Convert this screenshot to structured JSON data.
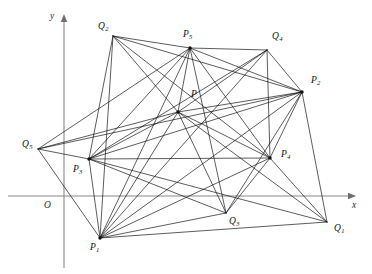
{
  "figure": {
    "width": 372,
    "height": 274,
    "background_color": "#ffffff",
    "line_color": "#101010",
    "axis_color": "#8a8a8a"
  },
  "axes": {
    "origin_label": "O",
    "origin_label_x": 44,
    "origin_label_y": 201,
    "x_axis_label": "x",
    "x_axis_label_x": 352,
    "x_axis_label_y": 201,
    "y_axis_label": "y",
    "y_axis_label_x": 50,
    "y_axis_label_y": 12,
    "origin_x": 64,
    "origin_y": 196,
    "x_axis_start_x": 8,
    "x_axis_end_x": 356,
    "y_axis_top_y": 14,
    "y_axis_bottom_y": 268
  },
  "points": [
    {
      "id": "P",
      "label": "P",
      "sub": "",
      "x": 178,
      "y": 112,
      "label_x": 191,
      "label_y": 90,
      "show_dot": true
    },
    {
      "id": "P1",
      "label": "P",
      "sub": "1",
      "x": 100,
      "y": 238,
      "label_x": 90,
      "label_y": 243,
      "show_dot": true
    },
    {
      "id": "P2",
      "label": "P",
      "sub": "2",
      "x": 302,
      "y": 92,
      "label_x": 311,
      "label_y": 76,
      "show_dot": true
    },
    {
      "id": "P3",
      "label": "P",
      "sub": "3",
      "x": 89,
      "y": 159,
      "label_x": 73,
      "label_y": 165,
      "show_dot": true
    },
    {
      "id": "P4",
      "label": "P",
      "sub": "4",
      "x": 270,
      "y": 158,
      "label_x": 281,
      "label_y": 150,
      "show_dot": true
    },
    {
      "id": "P5",
      "label": "P",
      "sub": "5",
      "x": 190,
      "y": 48,
      "label_x": 183,
      "label_y": 30,
      "show_dot": true
    },
    {
      "id": "Q1",
      "label": "Q",
      "sub": "1",
      "x": 327,
      "y": 222,
      "label_x": 334,
      "label_y": 224,
      "show_dot": false
    },
    {
      "id": "Q2",
      "label": "Q",
      "sub": "2",
      "x": 113,
      "y": 36,
      "label_x": 98,
      "label_y": 22,
      "show_dot": false
    },
    {
      "id": "Q3",
      "label": "Q",
      "sub": "3",
      "x": 226,
      "y": 213,
      "label_x": 229,
      "label_y": 217,
      "show_dot": false
    },
    {
      "id": "Q4",
      "label": "Q",
      "sub": "4",
      "x": 267,
      "y": 50,
      "label_x": 272,
      "label_y": 32,
      "show_dot": false
    },
    {
      "id": "Q5",
      "label": "Q",
      "sub": "5",
      "x": 38,
      "y": 149,
      "label_x": 22,
      "label_y": 140,
      "show_dot": false
    }
  ],
  "edges": [
    [
      "P",
      "P1"
    ],
    [
      "P",
      "P2"
    ],
    [
      "P",
      "P3"
    ],
    [
      "P",
      "P4"
    ],
    [
      "P",
      "P5"
    ],
    [
      "P",
      "Q1"
    ],
    [
      "P",
      "Q2"
    ],
    [
      "P",
      "Q3"
    ],
    [
      "P",
      "Q4"
    ],
    [
      "P",
      "Q5"
    ],
    [
      "P1",
      "P2"
    ],
    [
      "P1",
      "P3"
    ],
    [
      "P1",
      "P4"
    ],
    [
      "P1",
      "P5"
    ],
    [
      "P1",
      "Q1"
    ],
    [
      "P1",
      "Q2"
    ],
    [
      "P1",
      "Q3"
    ],
    [
      "P1",
      "Q4"
    ],
    [
      "P1",
      "Q5"
    ],
    [
      "P2",
      "P3"
    ],
    [
      "P2",
      "P4"
    ],
    [
      "P2",
      "P5"
    ],
    [
      "P2",
      "Q1"
    ],
    [
      "P2",
      "Q2"
    ],
    [
      "P2",
      "Q3"
    ],
    [
      "P2",
      "Q4"
    ],
    [
      "P2",
      "Q5"
    ],
    [
      "P3",
      "P4"
    ],
    [
      "P3",
      "P5"
    ],
    [
      "P3",
      "Q1"
    ],
    [
      "P3",
      "Q2"
    ],
    [
      "P3",
      "Q3"
    ],
    [
      "P3",
      "Q4"
    ],
    [
      "P3",
      "Q5"
    ],
    [
      "P4",
      "P5"
    ],
    [
      "P4",
      "Q1"
    ],
    [
      "P4",
      "Q2"
    ],
    [
      "P4",
      "Q3"
    ],
    [
      "P4",
      "Q4"
    ],
    [
      "P5",
      "Q2"
    ],
    [
      "P5",
      "Q3"
    ],
    [
      "P5",
      "Q4"
    ],
    [
      "P5",
      "Q5"
    ]
  ]
}
